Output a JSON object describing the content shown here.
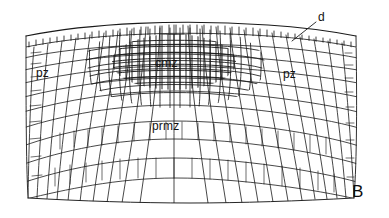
{
  "figure": {
    "panel_label": "B",
    "caption_present": false,
    "background_color": "#ffffff",
    "ink_color": "#1a1a1a"
  },
  "labels": {
    "central_mother_zone": "cmz",
    "peripheral_zone_left": "pz",
    "peripheral_zone_right": "pz",
    "pith_rib_meristem_zone": "prmz",
    "dermatogen": "d"
  },
  "leader_lines": [
    {
      "name": "d-leader",
      "from_x": 316,
      "from_y": 22,
      "to_x": 292,
      "to_y": 41
    }
  ],
  "zones": [
    {
      "id": "cmz",
      "label": "cmz",
      "description": "central mother cell zone, small dense cells",
      "cell_size": "small"
    },
    {
      "id": "pz-left",
      "label": "pz",
      "description": "peripheral zone left flank",
      "cell_size": "medium"
    },
    {
      "id": "pz-right",
      "label": "pz",
      "description": "peripheral zone right flank",
      "cell_size": "medium"
    },
    {
      "id": "prmz",
      "label": "prmz",
      "description": "pith rib meristem zone, radiating files",
      "cell_size": "large"
    },
    {
      "id": "d",
      "label": "d",
      "description": "dermatogen / outer epidermal layer",
      "cell_size": "small-regular"
    }
  ]
}
